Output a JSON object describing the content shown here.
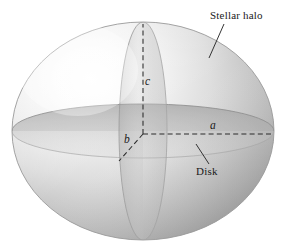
{
  "figure": {
    "background_color": "#ffffff",
    "width": 287,
    "height": 247
  },
  "labels": {
    "stellar_halo": "Stellar halo",
    "disk": "Disk",
    "axis_a": "a",
    "axis_b": "b",
    "axis_c": "c"
  },
  "colors": {
    "ink": "#1a1a1a",
    "halo_highlight": "#fdfdfd",
    "halo_midtone": "#d2d2d2",
    "halo_shadow": "#9d9d9d",
    "disk_band": "#bdbdbd",
    "vertical_ring": "#c9c9c9",
    "outline": "#8e8e8e"
  },
  "geometry": {
    "halo_center_x": 143,
    "halo_center_y": 131,
    "halo_radius_x": 131,
    "halo_radius_y": 109,
    "disk_radius_x": 131,
    "disk_radius_y": 27,
    "vertical_ring_radius_x": 24,
    "vertical_ring_radius_y": 109,
    "axis_a_end_x": 272,
    "axis_a_end_y": 134,
    "axis_c_end_y": 24,
    "axis_b_end_x": 120,
    "axis_b_end_y": 160
  },
  "shapes": {
    "halo_name": "stellar-halo-ellipsoid",
    "disk_name": "galactic-disk-ellipse",
    "ring_name": "vertical-meridian-ring"
  }
}
